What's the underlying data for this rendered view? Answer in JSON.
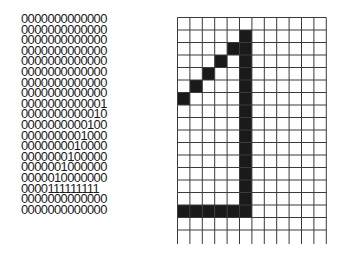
{
  "bitmap_text": {
    "rows": [
      "0000000000000",
      "0000000000000",
      "0000000000000",
      "0000000000000",
      "0000000000000",
      "0000000000000",
      "0000000000000",
      "0000000000000",
      "0000000000001",
      "0000000000010",
      "0000000000100",
      "0000000001000",
      "0000000010000",
      "0000000100000",
      "0000001000000",
      "0000010000000",
      "0000111111111",
      "0000000000000",
      "0000000000000"
    ]
  },
  "pixel_grid": {
    "columns": 12,
    "rows": 17,
    "cell_width": 12.4,
    "cell_height": 12.5,
    "extra_tail": 14,
    "line_color": "#3a3a3a",
    "fill_color": "#1a1a1a",
    "filled_cells": [
      [
        1,
        5
      ],
      [
        2,
        5
      ],
      [
        3,
        5
      ],
      [
        4,
        5
      ],
      [
        5,
        5
      ],
      [
        6,
        5
      ],
      [
        7,
        5
      ],
      [
        8,
        5
      ],
      [
        9,
        5
      ],
      [
        10,
        5
      ],
      [
        11,
        5
      ],
      [
        12,
        5
      ],
      [
        13,
        5
      ],
      [
        14,
        5
      ],
      [
        15,
        5
      ],
      [
        2,
        4
      ],
      [
        3,
        3
      ],
      [
        4,
        2
      ],
      [
        5,
        1
      ],
      [
        6,
        0
      ],
      [
        15,
        0
      ],
      [
        15,
        1
      ],
      [
        15,
        2
      ],
      [
        15,
        3
      ],
      [
        15,
        4
      ]
    ]
  }
}
